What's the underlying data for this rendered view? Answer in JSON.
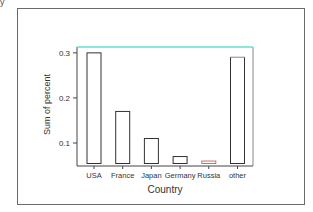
{
  "corner_fragment": "y",
  "chart_data": {
    "type": "bar",
    "title": "",
    "xlabel": "Country",
    "ylabel": "Sum of percent",
    "categories": [
      "USA",
      "France",
      "Japan",
      "Germany",
      "Russia",
      "other"
    ],
    "values": [
      0.3,
      0.17,
      0.11,
      0.07,
      0.06,
      0.29
    ],
    "bar_colors": [
      "#333333",
      "#333333",
      "#333333",
      "#333333",
      "#d46a6a",
      "#333333"
    ],
    "yticks": [
      0.1,
      0.2,
      0.3
    ],
    "ytick_labels": [
      "0.1",
      "0.2",
      "0.3"
    ],
    "ylim": [
      0.049,
      0.313
    ],
    "grid": false,
    "legend": null,
    "top_line_color": "#5fe0d0",
    "other_top_color": "#8fd68f"
  }
}
